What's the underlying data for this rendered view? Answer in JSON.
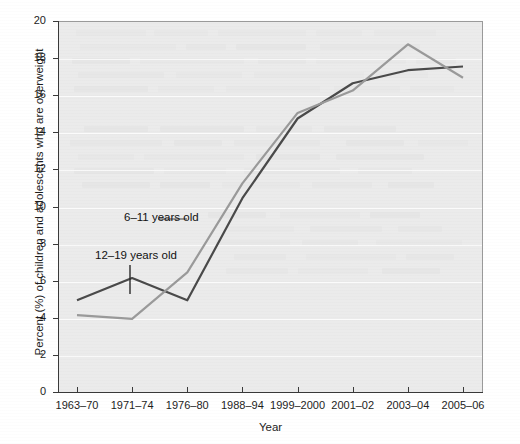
{
  "chart_data": {
    "type": "line",
    "title": "",
    "subtitle": "",
    "xlabel": "Year",
    "ylabel": "Percent (%) of children and adolescents who are overweight",
    "categories": [
      "1963–70",
      "1971–74",
      "1976–80",
      "1988–94",
      "1999–2000",
      "2001–02",
      "2003–04",
      "2005–06"
    ],
    "x_tick_labels": [
      "1963–70",
      "1971–74",
      "1976–80",
      "1988–94",
      "1999–2000",
      "2001–02",
      "2003–04",
      "2005–06"
    ],
    "y_tick_labels": [
      "0",
      "2",
      "4",
      "6",
      "8",
      "10",
      "12",
      "14",
      "16",
      "18",
      "20"
    ],
    "y_ticks": [
      0,
      2,
      4,
      6,
      8,
      10,
      12,
      14,
      16,
      18,
      20
    ],
    "ylim": [
      0,
      20
    ],
    "grid": "horizontal",
    "legend_position": "inline-annotations",
    "series": [
      {
        "name": "6–11 years old",
        "label": "6–11 years old",
        "color": "#9a9a9a",
        "values": [
          4.2,
          4.0,
          6.5,
          11.3,
          15.1,
          16.3,
          18.8,
          17.0
        ]
      },
      {
        "name": "12–19 years old",
        "label": "12–19 years old",
        "color": "#4a4a4a",
        "values": [
          5.0,
          6.2,
          5.0,
          10.5,
          14.8,
          16.7,
          17.4,
          17.6
        ]
      }
    ],
    "annotations": [
      {
        "text": "6–11 years old",
        "series": "6–11 years old"
      },
      {
        "text": "12–19 years old",
        "series": "12–19 years old"
      }
    ],
    "colors": {
      "plot_background": "#ebebeb",
      "gridline": "#fbfbfb",
      "axis": "#3a3a3a",
      "series_6_11": "#9a9a9a",
      "series_12_19": "#4a4a4a"
    }
  }
}
